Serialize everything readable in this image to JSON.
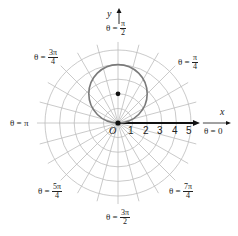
{
  "diagram": {
    "origin_px": [
      118,
      123
    ],
    "unit_px": 14.6,
    "rings": [
      1,
      2,
      3,
      4,
      5
    ],
    "radial_step_deg": 15,
    "curve": {
      "type": "circle",
      "equation": "r = 4 sin θ",
      "center_rect": [
        0,
        2
      ],
      "radius": 2,
      "color": "#777777"
    },
    "center_point": [
      0,
      2
    ],
    "origin_point": [
      0,
      0
    ],
    "polar_axis_arrow_length": 5.2,
    "colors": {
      "grid": "#bdbdbd",
      "curve": "#7a7a7a",
      "axis": "#111111",
      "text": "#222222"
    }
  },
  "axes": {
    "x_label": "x",
    "y_label": "y",
    "origin_label": "O",
    "ticks": [
      "1",
      "2",
      "3",
      "4",
      "5"
    ]
  },
  "angle_labels": {
    "theta_0": {
      "prefix": "θ = ",
      "value": "0"
    },
    "theta_pi_4": {
      "prefix": "θ = ",
      "num": "π",
      "den": "4"
    },
    "theta_pi_2": {
      "prefix": "θ = ",
      "num": "π",
      "den": "2"
    },
    "theta_3pi_4": {
      "prefix": "θ = ",
      "num": "3π",
      "den": "4"
    },
    "theta_pi": {
      "prefix": "θ = ",
      "value": "π"
    },
    "theta_5pi_4": {
      "prefix": "θ = ",
      "num": "5π",
      "den": "4"
    },
    "theta_3pi_2": {
      "prefix": "θ = ",
      "num": "3π",
      "den": "2"
    },
    "theta_7pi_4": {
      "prefix": "θ = ",
      "num": "7π",
      "den": "4"
    }
  }
}
